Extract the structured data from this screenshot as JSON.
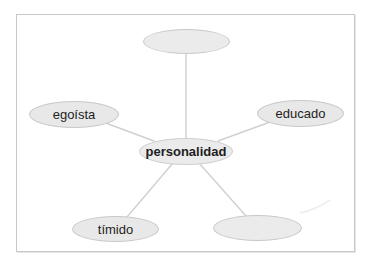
{
  "diagram": {
    "type": "word-web",
    "colors": {
      "node_fill": "#e8e8e8",
      "node_border": "#c9c9c9",
      "connector": "#d0d0d0",
      "frame_border": "#c8c8c8",
      "text": "#1e1e1e"
    },
    "center": {
      "label": "personalidad"
    },
    "nodes": [
      {
        "position": "top",
        "label": ""
      },
      {
        "position": "left",
        "label": "egoísta"
      },
      {
        "position": "right",
        "label": "educado"
      },
      {
        "position": "bottom-left",
        "label": "tímido"
      },
      {
        "position": "bottom-right",
        "label": ""
      }
    ]
  }
}
